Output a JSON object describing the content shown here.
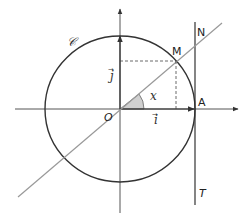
{
  "diagram": {
    "labels": {
      "circle": "𝒞",
      "origin": "O",
      "point_a": "A",
      "point_m": "M",
      "point_n": "N",
      "tangent": "T",
      "angle": "x",
      "vector_i": "i",
      "vector_j": "j",
      "arrow_i": "→",
      "arrow_j": "→"
    },
    "colors": {
      "axis": "#333333",
      "circle": "#333333",
      "line": "#999999",
      "tangent": "#333333",
      "angle_fill": "#d0d0d0",
      "dashed": "#444444"
    }
  }
}
